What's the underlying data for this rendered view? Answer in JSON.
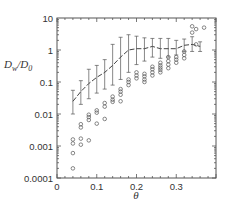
{
  "chart_data": {
    "type": "scatter",
    "title": "",
    "xlabel": "θ",
    "ylabel": "Dw/D0",
    "ylabel_parts": {
      "main": "D",
      "sub1": "w",
      "slash": "/D",
      "sub2": "0"
    },
    "xlim": [
      0,
      0.4
    ],
    "ylim": [
      0.0001,
      10
    ],
    "yscale": "log",
    "grid": false,
    "x_ticks": [
      0,
      0.1,
      0.2,
      0.3
    ],
    "x_tick_labels": [
      "0",
      "0.1",
      "0.2",
      "0.3"
    ],
    "y_ticks": [
      0.0001,
      0.001,
      0.01,
      0.1,
      1,
      10
    ],
    "y_tick_labels": [
      "0.0001",
      "0.001",
      "0.01",
      "0.1",
      "1",
      "10"
    ],
    "series": [
      {
        "name": "mean with error bars",
        "style": "dashed-line-errorbar",
        "x": [
          0.04,
          0.06,
          0.08,
          0.1,
          0.12,
          0.14,
          0.16,
          0.18,
          0.2,
          0.22,
          0.24,
          0.26,
          0.28,
          0.3,
          0.32,
          0.34,
          0.36
        ],
        "y": [
          0.025,
          0.05,
          0.09,
          0.14,
          0.2,
          0.33,
          0.6,
          1.0,
          1.1,
          1.1,
          1.3,
          1.1,
          1.1,
          1.1,
          1.4,
          1.5,
          1.3
        ],
        "ylow": [
          0.01,
          0.02,
          0.03,
          0.045,
          0.06,
          0.08,
          0.12,
          0.2,
          0.35,
          0.45,
          0.6,
          0.55,
          0.6,
          0.7,
          0.9,
          0.9,
          0.9
        ],
        "yhigh": [
          0.055,
          0.11,
          0.25,
          0.33,
          0.5,
          1.5,
          2.5,
          3.0,
          2.7,
          2.4,
          2.3,
          2.3,
          2.3,
          2.0,
          2.2,
          2.6,
          1.8
        ]
      },
      {
        "name": "individual values",
        "style": "open-circle",
        "points": [
          [
            0.04,
            0.0016
          ],
          [
            0.04,
            0.0012
          ],
          [
            0.04,
            0.0006
          ],
          [
            0.04,
            0.0002
          ],
          [
            0.06,
            0.0017
          ],
          [
            0.06,
            0.0011
          ],
          [
            0.06,
            0.0048
          ],
          [
            0.06,
            0.0038
          ],
          [
            0.08,
            0.0095
          ],
          [
            0.08,
            0.008
          ],
          [
            0.08,
            0.0065
          ],
          [
            0.08,
            0.0015
          ],
          [
            0.1,
            0.013
          ],
          [
            0.1,
            0.011
          ],
          [
            0.1,
            0.005
          ],
          [
            0.12,
            0.022
          ],
          [
            0.12,
            0.017
          ],
          [
            0.12,
            0.007
          ],
          [
            0.14,
            0.035
          ],
          [
            0.14,
            0.028
          ],
          [
            0.14,
            0.024
          ],
          [
            0.16,
            0.06
          ],
          [
            0.16,
            0.05
          ],
          [
            0.16,
            0.04
          ],
          [
            0.16,
            0.025
          ],
          [
            0.18,
            0.12
          ],
          [
            0.18,
            0.1
          ],
          [
            0.18,
            0.08
          ],
          [
            0.2,
            0.2
          ],
          [
            0.2,
            0.16
          ],
          [
            0.2,
            0.13
          ],
          [
            0.22,
            0.18
          ],
          [
            0.22,
            0.15
          ],
          [
            0.22,
            0.12
          ],
          [
            0.22,
            0.1
          ],
          [
            0.24,
            0.3
          ],
          [
            0.24,
            0.25
          ],
          [
            0.24,
            0.2
          ],
          [
            0.24,
            0.16
          ],
          [
            0.26,
            0.4
          ],
          [
            0.26,
            0.33
          ],
          [
            0.26,
            0.28
          ],
          [
            0.26,
            0.24
          ],
          [
            0.26,
            0.2
          ],
          [
            0.28,
            0.6
          ],
          [
            0.28,
            0.45
          ],
          [
            0.28,
            0.35
          ],
          [
            0.28,
            0.27
          ],
          [
            0.3,
            0.6
          ],
          [
            0.3,
            0.5
          ],
          [
            0.3,
            0.4
          ],
          [
            0.32,
            0.9
          ],
          [
            0.32,
            0.7
          ],
          [
            0.32,
            0.55
          ],
          [
            0.34,
            5.5
          ],
          [
            0.34,
            3.5
          ],
          [
            0.35,
            4.5
          ],
          [
            0.37,
            5.0
          ],
          [
            0.35,
            1.5
          ]
        ]
      }
    ]
  }
}
